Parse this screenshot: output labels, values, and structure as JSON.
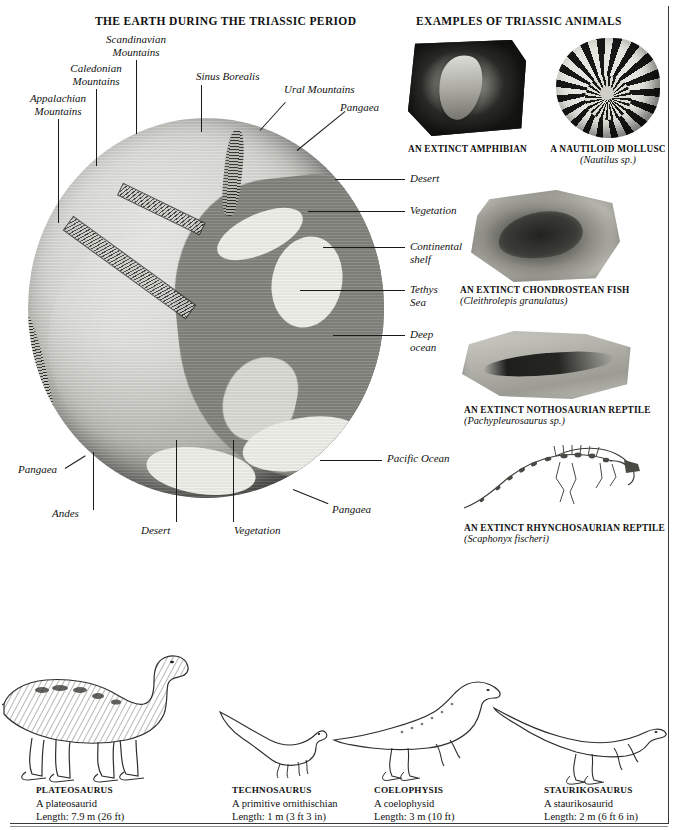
{
  "page": {
    "background_color": "#ffffff",
    "border_color": "#3a3a3a"
  },
  "headings": {
    "earth": "THE EARTH DURING THE TRIASSIC PERIOD",
    "animals": "EXAMPLES OF TRIASSIC ANIMALS"
  },
  "globe_labels": [
    {
      "id": "scandinavian-mountains",
      "text": "Scandinavian\nMountains"
    },
    {
      "id": "caledonian-mountains",
      "text": "Caledonian\nMountains"
    },
    {
      "id": "appalachian-mountains",
      "text": "Appalachian\nMountains"
    },
    {
      "id": "sinus-borealis",
      "text": "Sinus Borealis"
    },
    {
      "id": "ural-mountains",
      "text": "Ural Mountains"
    },
    {
      "id": "pangaea-top",
      "text": "Pangaea"
    },
    {
      "id": "desert-right",
      "text": "Desert"
    },
    {
      "id": "vegetation-right",
      "text": "Vegetation"
    },
    {
      "id": "continental-shelf",
      "text": "Continental\nshelf"
    },
    {
      "id": "tethys-sea",
      "text": "Tethys\nSea"
    },
    {
      "id": "deep-ocean",
      "text": "Deep\nocean"
    },
    {
      "id": "pacific-ocean",
      "text": "Pacific Ocean"
    },
    {
      "id": "pangaea-right",
      "text": "Pangaea"
    },
    {
      "id": "pangaea-left",
      "text": "Pangaea"
    },
    {
      "id": "andes",
      "text": "Andes"
    },
    {
      "id": "desert-bottom",
      "text": "Desert"
    },
    {
      "id": "vegetation-bottom",
      "text": "Vegetation"
    }
  ],
  "fossils": [
    {
      "id": "amphibian",
      "name": "AN EXTINCT AMPHIBIAN",
      "species": ""
    },
    {
      "id": "nautiloid",
      "name": "A NAUTILOID MOLLUSC",
      "species": "(Nautilus sp.)"
    },
    {
      "id": "chondrostean-fish",
      "name": "AN EXTINCT CHONDROSTEAN FISH",
      "species": "(Cleithrolepis granulatus)"
    },
    {
      "id": "nothosaurian-reptile",
      "name": "AN EXTINCT NOTHOSAURIAN REPTILE",
      "species": "(Pachypleurosaurus sp.)"
    },
    {
      "id": "rhynchosaurian-reptile",
      "name": "AN EXTINCT RHYNCHOSAURIAN REPTILE",
      "species": "(Scaphonyx fischeri)"
    }
  ],
  "dinosaurs": [
    {
      "id": "plateosaurus",
      "name": "PLATEOSAURUS",
      "group": "A plateosaurid",
      "length": "Length: 7.9 m (26 ft)"
    },
    {
      "id": "technosaurus",
      "name": "TECHNOSAURUS",
      "group": "A primitive ornithischian",
      "length": "Length: 1 m (3 ft 3 in)"
    },
    {
      "id": "coelophysis",
      "name": "COELOPHYSIS",
      "group": "A coelophysid",
      "length": "Length: 3 m (10 ft)"
    },
    {
      "id": "staurikosaurus",
      "name": "STAURIKOSAURUS",
      "group": "A staurikosaurid",
      "length": "Length: 2 m (6 ft 6 in)"
    }
  ]
}
